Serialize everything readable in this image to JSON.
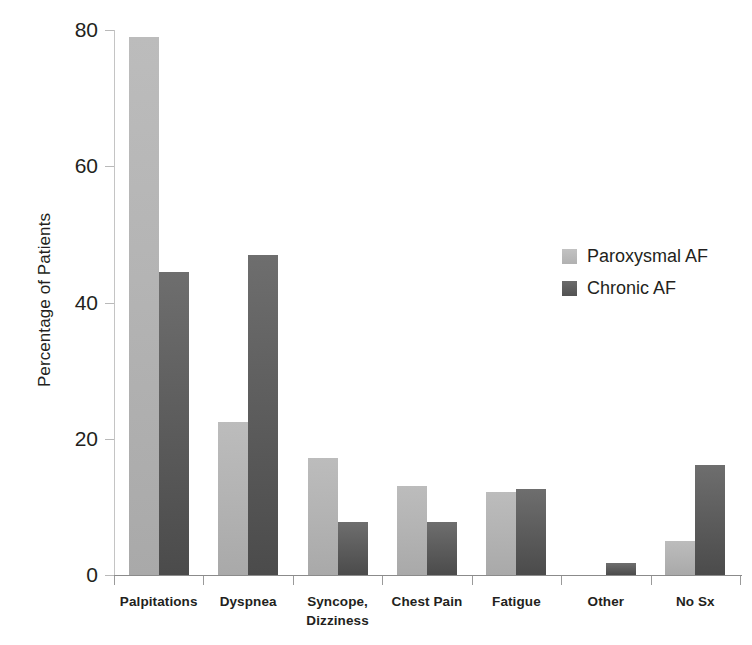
{
  "chart_data": {
    "type": "bar",
    "title": "",
    "subtitle": "",
    "xlabel": "",
    "ylabel": "Percentage of Patients",
    "ylim": [
      0,
      80
    ],
    "yticks": [
      0,
      20,
      40,
      60,
      80
    ],
    "ytick_labels": [
      "0",
      "20",
      "40",
      "60",
      "80"
    ],
    "grid": false,
    "legend_position": "center-right",
    "grouping": "grouped",
    "categories": [
      "Palpitations",
      "Dyspnea",
      "Syncope, Dizziness",
      "Chest Pain",
      "Fatigue",
      "Other",
      "No Sx"
    ],
    "category_label_lines": [
      [
        "Palpitations"
      ],
      [
        "Dyspnea"
      ],
      [
        "Syncope,",
        "Dizziness"
      ],
      [
        "Chest Pain"
      ],
      [
        "Fatigue"
      ],
      [
        "Other"
      ],
      [
        "No Sx"
      ]
    ],
    "series": [
      {
        "name": "Paroxysmal AF",
        "color": "#b4b4b4",
        "values": [
          79.0,
          22.5,
          17.2,
          13.1,
          12.2,
          0.0,
          5.0
        ]
      },
      {
        "name": "Chronic AF",
        "color": "#575757",
        "values": [
          44.5,
          47.0,
          7.8,
          7.8,
          12.6,
          1.8,
          16.1
        ]
      }
    ]
  },
  "legend": {
    "items": [
      {
        "label": "Paroxysmal AF"
      },
      {
        "label": "Chronic AF"
      }
    ]
  },
  "axes": {
    "y_title": "Percentage of Patients"
  }
}
